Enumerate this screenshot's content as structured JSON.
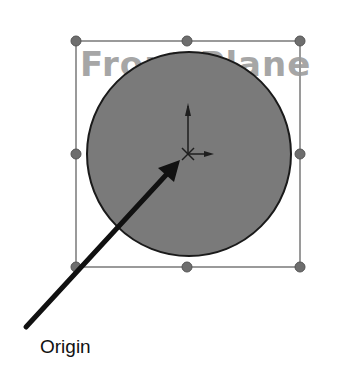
{
  "diagram": {
    "plane_label": "Front Plane",
    "callout_label": "Origin",
    "colors": {
      "circle_fill": "#7a7a7a",
      "circle_stroke": "#1a1a1a",
      "box_stroke": "#9a9a9a",
      "handle_fill": "#6e6e6e",
      "plane_text": "#a6a6a6",
      "arrow": "#111111",
      "callout_text": "#111111"
    },
    "bounding_box": {
      "left": 76,
      "top": 41,
      "right": 300,
      "bottom": 267
    },
    "circle": {
      "cx": 189,
      "cy": 154,
      "r": 102
    },
    "origin": {
      "x": 188,
      "y": 154
    },
    "arrow": {
      "from": [
        26,
        327
      ],
      "to": [
        180,
        160
      ]
    },
    "handles": [
      [
        76,
        41
      ],
      [
        187,
        41
      ],
      [
        300,
        41
      ],
      [
        76,
        154
      ],
      [
        300,
        154
      ],
      [
        76,
        267
      ],
      [
        187,
        267
      ],
      [
        300,
        267
      ]
    ]
  }
}
